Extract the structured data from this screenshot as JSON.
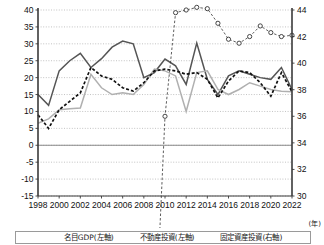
{
  "chart_data": {
    "type": "line",
    "title": "",
    "xlabel": "(年)",
    "ylabel_left": "",
    "ylabel_right": "",
    "x": [
      1998,
      1999,
      2000,
      2001,
      2002,
      2003,
      2004,
      2005,
      2006,
      2007,
      2008,
      2009,
      2010,
      2011,
      2012,
      2013,
      2014,
      2015,
      2016,
      2017,
      2018,
      2019,
      2020,
      2021,
      2022
    ],
    "xticks": [
      "1998",
      "2000",
      "2002",
      "2004",
      "2006",
      "2008",
      "2010",
      "2012",
      "2014",
      "2016",
      "2018",
      "2020",
      "2022"
    ],
    "yticks_left": [
      "40",
      "35",
      "30",
      "25",
      "20",
      "15",
      "10",
      "5",
      "0",
      "-5",
      "-10",
      "-15"
    ],
    "yticks_right": [
      "44",
      "42",
      "40",
      "38",
      "36",
      "34",
      "32",
      "30"
    ],
    "ylim_left": [
      -15,
      40
    ],
    "ylim_right": [
      30,
      44
    ],
    "grid": true,
    "legend_position": "bottom",
    "series": [
      {
        "name": "名目GDP(左軸)",
        "axis": "left",
        "style": "solid-dark",
        "color": "#555555",
        "values": [
          15.0,
          11.8,
          22.0,
          25.0,
          27.2,
          23.0,
          25.6,
          29.0,
          30.8,
          30.0,
          20.0,
          21.5,
          25.5,
          23.5,
          18.0,
          30.2,
          19.5,
          15.0,
          20.5,
          22.0,
          21.0,
          20.0,
          19.5,
          23.0,
          16.5
        ]
      },
      {
        "name": "不動産投資(左軸)",
        "axis": "left",
        "style": "solid-light",
        "color": "#b0b0b0",
        "values": [
          6.5,
          7.8,
          10.5,
          10.8,
          11.0,
          21.0,
          17.0,
          15.0,
          15.5,
          15.0,
          18.0,
          22.5,
          22.0,
          20.5,
          10.0,
          21.5,
          22.0,
          16.5,
          15.0,
          16.5,
          18.5,
          17.5,
          16.5,
          16.0,
          15.8
        ]
      },
      {
        "name": "固定資産投資(右軸)",
        "axis": "left",
        "style": "dashed-black",
        "color": "#111111",
        "values": [
          9.0,
          5.0,
          10.5,
          13.0,
          15.5,
          23.0,
          20.5,
          19.5,
          17.0,
          16.0,
          18.5,
          22.0,
          22.5,
          22.0,
          21.0,
          21.5,
          19.5,
          14.0,
          19.0,
          22.0,
          21.5,
          18.5,
          14.5,
          21.5,
          15.8
        ]
      },
      {
        "name": "固定資産投資比率(右軸)",
        "axis": "right",
        "style": "dashed-marker",
        "color": "#333333",
        "values": [
          -4.0,
          -5.0,
          -5.0,
          -2.2,
          4.0,
          10.0,
          15.5,
          20.5,
          19.5,
          17.0,
          13.5,
          18.5,
          36.0,
          43.8,
          44.0,
          44.2,
          44.1,
          43.0,
          41.8,
          41.5,
          42.0,
          42.8,
          42.3,
          42.0,
          42.1
        ]
      }
    ]
  },
  "legend": {
    "items": [
      {
        "label": "名目GDP(左軸)",
        "style": "solid-dark"
      },
      {
        "label": "不動産投資(左軸)",
        "style": "solid-light"
      },
      {
        "label": "固定資産投資(右軸)",
        "style": "dashed-black"
      }
    ]
  },
  "axes": {
    "x_unit": "(年)"
  }
}
